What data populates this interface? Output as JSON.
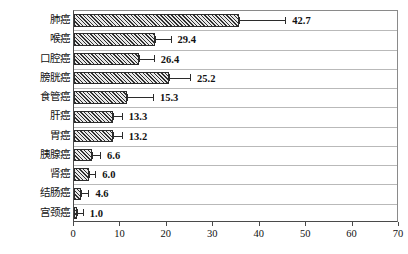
{
  "chart_data": {
    "type": "bar",
    "orientation": "horizontal",
    "title": "",
    "subtitle": "",
    "xlabel": "",
    "ylabel": "",
    "xlim": [
      0,
      70
    ],
    "ylim": null,
    "grid": true,
    "legend": null,
    "legend_position": "none",
    "xticks": [
      0,
      10,
      20,
      30,
      40,
      50,
      60,
      70
    ],
    "xtick_labels": [
      "0",
      "10",
      "20",
      "30",
      "40",
      "50",
      "60",
      "70"
    ],
    "categories": [
      "肺癌",
      "喉癌",
      "口腔癌",
      "膀胱癌",
      "食管癌",
      "肝癌",
      "胃癌",
      "胰腺癌",
      "肾癌",
      "结肠癌",
      "宫颈癌"
    ],
    "values": [
      42.7,
      29.4,
      26.4,
      25.2,
      15.3,
      13.3,
      13.2,
      6.6,
      6.0,
      4.6,
      1.0
    ],
    "value_labels": [
      "42.7",
      "29.4",
      "26.4",
      "25.2",
      "15.3",
      "13.3",
      "13.2",
      "6.6",
      "6.0",
      "4.6",
      "1.0"
    ],
    "bar_ends": [
      35.5,
      17.5,
      14.0,
      20.5,
      11.5,
      8.5,
      8.5,
      3.8,
      3.2,
      1.6,
      0.7
    ],
    "error_highs": [
      45.5,
      20.8,
      17.2,
      25.0,
      17.0,
      10.3,
      10.3,
      5.6,
      4.6,
      3.1,
      1.9
    ],
    "bar_style": {
      "fill": "diagonal-hatch",
      "hatch_color": "#2f2f2f",
      "background": "#e8e8e8",
      "edge_color": "#2b2b2b"
    },
    "axis_color": "#4a4a4a",
    "gridline_color": "#b9b9b9"
  }
}
